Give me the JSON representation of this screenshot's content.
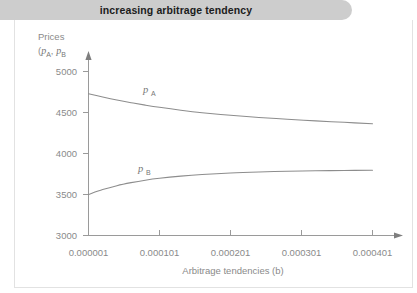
{
  "header": {
    "title": "increasing arbitrage tendency"
  },
  "axes": {
    "y_label_line1": "Prices",
    "y_label_line2_open": "(",
    "y_label_p_a": "p",
    "y_label_p_a_sub": "A",
    "y_label_comma": ", ",
    "y_label_p_b": "p",
    "y_label_p_b_sub": "B",
    "x_title": "Arbitrage tendencies (b)"
  },
  "chart_data": {
    "type": "line",
    "title": "increasing arbitrage tendency",
    "xlabel": "Arbitrage tendencies (b)",
    "ylabel": "Prices (pA, pB",
    "xlim": [
      1e-06,
      0.000441
    ],
    "ylim": [
      3000,
      5150
    ],
    "grid": false,
    "legend": "inline-curve-labels",
    "xticks": [
      "0.000001",
      "0.000101",
      "0.000201",
      "0.000301",
      "0.000401"
    ],
    "xtick_values": [
      1e-06,
      0.000101,
      0.000201,
      0.000301,
      0.000401
    ],
    "yticks": [
      "3000",
      "3500",
      "4000",
      "4500",
      "5000"
    ],
    "ytick_values": [
      3000,
      3500,
      4000,
      4500,
      5000
    ],
    "x": [
      1e-06,
      2.1e-05,
      4.1e-05,
      6.1e-05,
      8.1e-05,
      0.000101,
      0.000131,
      0.000161,
      0.000201,
      0.000241,
      0.000281,
      0.000321,
      0.000361,
      0.000401
    ],
    "series": [
      {
        "name": "pA",
        "label": "p_A",
        "color": "#8d8d8d",
        "values": [
          4730,
          4690,
          4653,
          4620,
          4590,
          4563,
          4528,
          4498,
          4466,
          4440,
          4418,
          4398,
          4380,
          4363
        ]
      },
      {
        "name": "pB",
        "label": "p_B",
        "color": "#8d8d8d",
        "values": [
          3500,
          3560,
          3608,
          3645,
          3675,
          3698,
          3724,
          3744,
          3763,
          3775,
          3783,
          3789,
          3793,
          3796
        ]
      }
    ],
    "annotations": [
      {
        "text": "pA",
        "x": 7.6e-05,
        "y": 4720
      },
      {
        "text": "pB",
        "x": 7.1e-05,
        "y": 3830
      }
    ]
  },
  "colors": {
    "title_bar": "#cdcdcd",
    "axis": "#9a9a9a",
    "curve": "#8d8d8d",
    "text": "#8a8a8a",
    "panel_border": "#e2e2e2"
  }
}
